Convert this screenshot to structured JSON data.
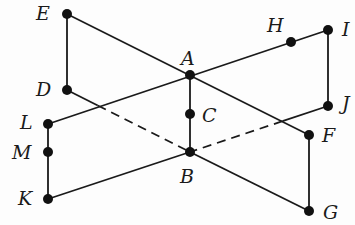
{
  "diagram": {
    "points": {
      "E": {
        "x": 67,
        "y": 14,
        "label": "E",
        "lx": 36,
        "ly": 4
      },
      "D": {
        "x": 67,
        "y": 90,
        "label": "D",
        "lx": 36,
        "ly": 80
      },
      "A": {
        "x": 190,
        "y": 75,
        "label": "A",
        "lx": 181,
        "ly": 49
      },
      "H": {
        "x": 291,
        "y": 42,
        "label": "H",
        "lx": 267,
        "ly": 16
      },
      "I": {
        "x": 328,
        "y": 30,
        "label": "I",
        "lx": 342,
        "ly": 20
      },
      "J": {
        "x": 328,
        "y": 106,
        "label": "J",
        "lx": 342,
        "ly": 94
      },
      "C": {
        "x": 190,
        "y": 114,
        "label": "C",
        "lx": 202,
        "ly": 106
      },
      "B": {
        "x": 190,
        "y": 152,
        "label": "B",
        "lx": 180,
        "ly": 167
      },
      "F": {
        "x": 309,
        "y": 135,
        "label": "F",
        "lx": 322,
        "ly": 126
      },
      "G": {
        "x": 309,
        "y": 211,
        "label": "G",
        "lx": 323,
        "ly": 203
      },
      "L": {
        "x": 48,
        "y": 124,
        "label": "L",
        "lx": 20,
        "ly": 113
      },
      "M": {
        "x": 48,
        "y": 152,
        "label": "M",
        "lx": 12,
        "ly": 143
      },
      "K": {
        "x": 48,
        "y": 199,
        "label": "K",
        "lx": 18,
        "ly": 189
      }
    },
    "solid_segments": [
      [
        "E",
        "D"
      ],
      [
        "E",
        "F"
      ],
      [
        "L",
        "I"
      ],
      [
        "I",
        "J"
      ],
      [
        "A",
        "B"
      ],
      [
        "L",
        "K"
      ],
      [
        "K",
        "B"
      ],
      [
        "B",
        "G"
      ],
      [
        "F",
        "G"
      ]
    ],
    "partial_segments": [
      {
        "from": "D",
        "to": "B",
        "solid_until": 0.25
      },
      {
        "from": "J",
        "to": "B",
        "solid_until": 0.33
      }
    ],
    "line_color": "#1a1a1a",
    "point_color": "#111111"
  }
}
